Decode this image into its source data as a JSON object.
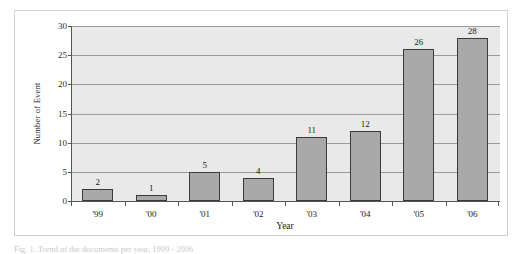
{
  "figure": {
    "caption": "Fig. 1. Trend of the documents per year, 1999 - 2006"
  },
  "chart_data": {
    "type": "bar",
    "title": "",
    "categories": [
      "'99",
      "'00",
      "'01",
      "'02",
      "'03",
      "'04",
      "'05",
      "'06"
    ],
    "values": [
      2,
      1,
      5,
      4,
      11,
      12,
      26,
      28
    ],
    "xlabel": "Year",
    "ylabel": "Number of Event",
    "ylim": [
      0,
      30
    ],
    "yticks": [
      0,
      5,
      10,
      15,
      20,
      25,
      30
    ],
    "ytick_labels": [
      "0",
      "5",
      "10",
      "15",
      "20",
      "25",
      "30"
    ],
    "grid": true,
    "legend": false,
    "data_labels": [
      "2",
      "1",
      "5",
      "4",
      "11",
      "12",
      "26",
      "28"
    ],
    "colors": {
      "bar_fill": "#a9a9a9",
      "bar_border": "#3a3a3a",
      "plot_background": "#e9e9e9",
      "gridline": "#9a9a9a",
      "axis": "#555555",
      "frame": "#cfcfcf",
      "page_background": "#ffffff"
    }
  }
}
